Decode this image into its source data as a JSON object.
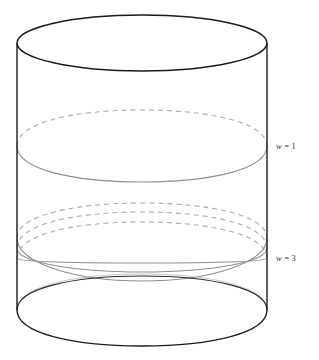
{
  "figure": {
    "name": "cylinder-winding-curves",
    "background_color": "#ffffff",
    "canvas": {
      "width": 319,
      "height": 360
    }
  },
  "cylinder": {
    "name": "cylinder-solid",
    "outline_color": "#1b1b1b",
    "outline_width": 1.4,
    "center_x": 142,
    "radius_x": 125,
    "radius_y": 28,
    "top_center_y": 43,
    "bottom_center_y": 310,
    "left_x": 17,
    "right_x": 267,
    "parts": {
      "top_ellipse": "top-rim-ellipse",
      "bottom_front_arc": "bottom-rim-front-arc",
      "bottom_back_arc": "bottom-rim-back-arc",
      "left_side": "left-side-line",
      "right_side": "right-side-line"
    }
  },
  "curves": {
    "color_solid": "#8c8f93",
    "color_dashed": "#a9acb0",
    "stroke_width": 1.1,
    "dash_pattern": "5,4",
    "groups": [
      {
        "name": "winding-curve-w1",
        "winding_number": 1,
        "label": "w = 1",
        "label_variable": "w",
        "label_equals": "=",
        "label_value": "1",
        "label_x": 276,
        "label_y": 149,
        "strand_count": 1,
        "center_y": 146,
        "radius_y": 18
      },
      {
        "name": "winding-curve-w3",
        "winding_number": 3,
        "label": "w = 3",
        "label_variable": "w",
        "label_equals": "=",
        "label_value": "3",
        "label_x": 276,
        "label_y": 261,
        "strand_count": 3,
        "back_apex_y": [
          203,
          212,
          222
        ],
        "front_apex_y": [
          281,
          272,
          263
        ],
        "edge_y": [
          238,
          248,
          258
        ],
        "radius_y": 18
      }
    ]
  },
  "labels": [
    {
      "name": "label-w-equals-1",
      "variable": "w",
      "equals": "=",
      "value": "1"
    },
    {
      "name": "label-w-equals-3",
      "variable": "w",
      "equals": "=",
      "value": "3"
    }
  ]
}
